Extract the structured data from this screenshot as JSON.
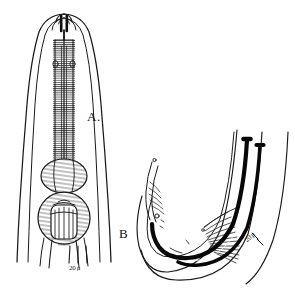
{
  "figure": {
    "kind": "scientific-line-drawing",
    "background_color": "#ffffff",
    "ink_color": "#1a1a1a",
    "panels": [
      {
        "id": "A",
        "label": "A.",
        "caption_letter": "A",
        "description": "anterior end showing striated esophagus with median and terminal bulbs",
        "scale_bar": {
          "label": "20 μ",
          "value": 20,
          "unit": "μ",
          "ticks": 3
        }
      },
      {
        "id": "B",
        "label": "B",
        "caption_letter": "B",
        "description": "curved male tail with paired spicules and fan of bursal rays",
        "scale_bar": {
          "label": "20 μ",
          "value": 20,
          "unit": "μ",
          "rotation_deg": -42
        }
      }
    ]
  }
}
